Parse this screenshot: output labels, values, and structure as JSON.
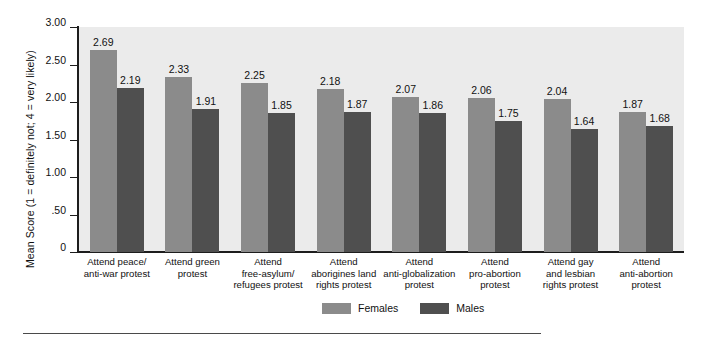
{
  "chart_data": {
    "type": "bar",
    "title": "",
    "xlabel": "",
    "ylabel": "Mean Score   (1 = definitely not; 4 = very likely)",
    "ylim": [
      0,
      3.0
    ],
    "ytick_labels": [
      "3.00",
      "2.50",
      "2.00",
      "1.50",
      "1.00",
      ".50",
      "0"
    ],
    "ytick_values": [
      3.0,
      2.5,
      2.0,
      1.5,
      1.0,
      0.5,
      0
    ],
    "grid": false,
    "legend_position": "bottom-center",
    "categories": [
      "Attend peace/\nanti-war protest",
      "Attend green\nprotest",
      "Attend\nfree-asylum/\nrefugees protest",
      "Attend\naborigines land\nrights protest",
      "Attend\nanti-globalization\nprotest",
      "Attend\npro-abortion\nprotest",
      "Attend gay\nand lesbian\nrights protest",
      "Attend\nanti-abortion\nprotest"
    ],
    "series": [
      {
        "name": "Females",
        "color": "#8b8b8b",
        "values": [
          2.69,
          2.33,
          2.25,
          2.18,
          2.07,
          2.06,
          2.04,
          1.87
        ],
        "labels": [
          "2.69",
          "2.33",
          "2.25",
          "2.18",
          "2.07",
          "2.06",
          "2.04",
          "1.87"
        ]
      },
      {
        "name": "Males",
        "color": "#4f4f4f",
        "values": [
          2.19,
          1.91,
          1.85,
          1.87,
          1.86,
          1.75,
          1.64,
          1.68
        ],
        "labels": [
          "2.19",
          "1.91",
          "1.85",
          "1.87",
          "1.86",
          "1.75",
          "1.64",
          "1.68"
        ]
      }
    ]
  },
  "legend": {
    "items": [
      {
        "label": "Females",
        "color": "#8b8b8b"
      },
      {
        "label": "Males",
        "color": "#4f4f4f"
      }
    ]
  },
  "colors": {
    "plot_background": "#ebebeb",
    "axis": "#1d1d1d",
    "page_background": "#ffffff",
    "female_bar": "#8b8b8b",
    "male_bar": "#4f4f4f"
  }
}
